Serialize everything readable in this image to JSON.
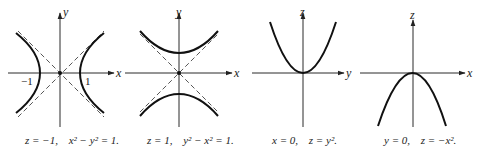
{
  "figure": {
    "panels": [
      {
        "id": "hyperbola-z-minus-1",
        "axes": {
          "horizontal": "x",
          "vertical": "y"
        },
        "tick_labels": [
          "−1",
          "1"
        ],
        "caption_left": "z = −1,",
        "caption_right": "x² − y² = 1."
      },
      {
        "id": "hyperbola-z-plus-1",
        "axes": {
          "horizontal": "x",
          "vertical": "y"
        },
        "tick_labels": [],
        "caption_left": "z = 1,",
        "caption_right": "y² − x² = 1."
      },
      {
        "id": "parabola-x-0",
        "axes": {
          "horizontal": "y",
          "vertical": "z"
        },
        "tick_labels": [],
        "caption_left": "x = 0,",
        "caption_right": "z = y²."
      },
      {
        "id": "parabola-y-0",
        "axes": {
          "horizontal": "x",
          "vertical": "z"
        },
        "tick_labels": [],
        "caption_left": "y = 0,",
        "caption_right": "z = −x²."
      }
    ],
    "colors": {
      "ink": "#111111",
      "background": "#ffffff"
    }
  }
}
